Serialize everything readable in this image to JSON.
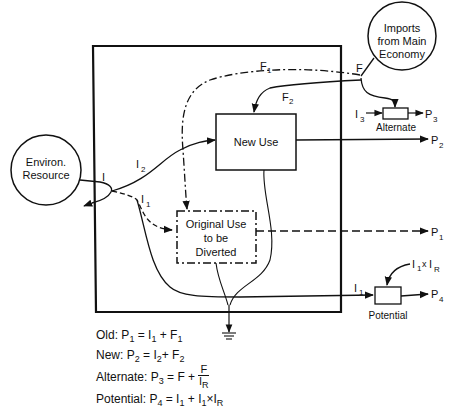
{
  "nodes": {
    "environ_resource": {
      "line1": "Environ.",
      "line2": "Resource"
    },
    "imports": {
      "line1": "Imports",
      "line2": "from Main",
      "line3": "Economy"
    },
    "new_use": {
      "label": "New Use"
    },
    "original_use": {
      "line1": "Original Use",
      "line2": "to be",
      "line3": "Diverted"
    },
    "alternate": {
      "label": "Alternate"
    },
    "potential": {
      "label": "Potential"
    }
  },
  "flow_labels": {
    "I": "I",
    "I1": "I",
    "I1_sub": "1",
    "I2": "I",
    "I2_sub": "2",
    "I3": "I",
    "I3_sub": "3",
    "I1_bottom": "I",
    "I1_bottom_sub": "1",
    "F": "F",
    "F1": "F",
    "F1_sub": "1",
    "F2": "F",
    "F2_sub": "2",
    "P1": "P",
    "P1_sub": "1",
    "P2": "P",
    "P2_sub": "2",
    "P3": "P",
    "P3_sub": "3",
    "P4": "P",
    "P4_sub": "4",
    "I1xIR": "I",
    "I1xIR_sub1": "1",
    "I1xIR_x": "x",
    "I1xIR_I": "I",
    "I1xIR_sub2": "R"
  },
  "equations": {
    "old": {
      "name": "Old:",
      "lhs": "P",
      "lhs_sub": "1",
      "rhs": "= I",
      "rhs_sub1": "1",
      "rhs2": " + F",
      "rhs_sub2": "1"
    },
    "new": {
      "name": "New:",
      "lhs": "P",
      "lhs_sub": "2",
      "rhs": "= I",
      "rhs_sub1": "2",
      "rhs2": "+ F",
      "rhs_sub2": "2"
    },
    "alternate": {
      "name": "Alternate:",
      "lhs": "P",
      "lhs_sub": "3",
      "rhs": "= F  +",
      "num": "F",
      "den": "I",
      "den_sub": "R"
    },
    "potential": {
      "name": "Potential:",
      "lhs": "P",
      "lhs_sub": "4",
      "rhs": "= I",
      "rhs_sub1": "1",
      "rhs2": " + I",
      "rhs_sub2": "1",
      "rhs3": "×I",
      "rhs_sub3": "R"
    }
  }
}
